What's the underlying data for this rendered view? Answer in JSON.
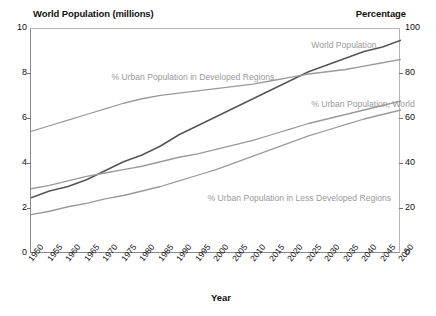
{
  "titles": {
    "left_axis": "World Population (millions)",
    "right_axis": "Percentage",
    "x_axis": "Year"
  },
  "colors": {
    "population_line": "#555555",
    "urban_line": "#9a9a9a",
    "axis": "#8a8a8a",
    "label_text": "#9a9a9a",
    "title_text": "#111111",
    "background": "#ffffff"
  },
  "chart_data": {
    "type": "line",
    "title": "",
    "xlabel": "Year",
    "ylabel": "World Population (millions)",
    "y2label": "Percentage",
    "grid": false,
    "legend": "inline-annotations",
    "xlim": [
      1950,
      2050
    ],
    "ylim": [
      0,
      10
    ],
    "y2lim": [
      0,
      100
    ],
    "yticks": [
      0,
      2,
      4,
      6,
      8,
      10
    ],
    "y2ticks": [
      0,
      20,
      40,
      60,
      80,
      100
    ],
    "categories": [
      "1950",
      "1955",
      "1960",
      "1965",
      "1970",
      "1975",
      "1980",
      "1985",
      "1990",
      "1995",
      "2000",
      "2005",
      "2010",
      "2015",
      "2020",
      "2025",
      "2030",
      "2035",
      "2040",
      "2045",
      "2050"
    ],
    "x": [
      1950,
      1955,
      1960,
      1965,
      1970,
      1975,
      1980,
      1985,
      1990,
      1995,
      2000,
      2005,
      2010,
      2015,
      2020,
      2025,
      2030,
      2035,
      2040,
      2045,
      2050
    ],
    "series": [
      {
        "name": "World Population",
        "axis": "left",
        "unit": "millions",
        "color": "#555555",
        "values": [
          2.5,
          2.8,
          3.0,
          3.3,
          3.7,
          4.1,
          4.4,
          4.8,
          5.3,
          5.7,
          6.1,
          6.5,
          6.9,
          7.3,
          7.7,
          8.1,
          8.4,
          8.7,
          9.0,
          9.2,
          9.5
        ]
      },
      {
        "name": "% Urban Population in Developed Regions",
        "axis": "right",
        "unit": "percent",
        "color": "#9a9a9a",
        "values": [
          54.5,
          57.0,
          59.5,
          62.0,
          64.5,
          67.0,
          69.0,
          70.5,
          71.5,
          72.5,
          73.5,
          74.5,
          75.5,
          77.0,
          78.5,
          80.0,
          81.0,
          82.0,
          83.5,
          85.0,
          86.5
        ]
      },
      {
        "name": "% Urban Population, World",
        "axis": "right",
        "unit": "percent",
        "color": "#9a9a9a",
        "values": [
          29.0,
          30.5,
          32.5,
          34.5,
          36.0,
          37.5,
          39.0,
          41.0,
          43.0,
          44.5,
          46.5,
          48.5,
          50.5,
          53.0,
          55.5,
          58.0,
          60.0,
          62.0,
          64.0,
          66.0,
          68.0
        ]
      },
      {
        "name": "% Urban Population in Less Developed Regions",
        "axis": "right",
        "unit": "percent",
        "color": "#9a9a9a",
        "values": [
          17.5,
          19.0,
          21.0,
          22.5,
          24.5,
          26.0,
          28.0,
          30.0,
          32.5,
          35.0,
          37.5,
          40.5,
          43.5,
          46.5,
          49.5,
          52.5,
          55.0,
          57.5,
          60.0,
          62.0,
          64.0
        ]
      }
    ],
    "annotations": [
      {
        "text": "World Population",
        "x": 2026,
        "y2": 92
      },
      {
        "text": "% Urban Population in Developed Regions",
        "x": 1972,
        "y2": 78
      },
      {
        "text": "% Urban Population, World",
        "x": 2026,
        "y2": 66
      },
      {
        "text": "% Urban Population in Less Developed Regions",
        "x": 1998,
        "y2": 24
      }
    ]
  }
}
